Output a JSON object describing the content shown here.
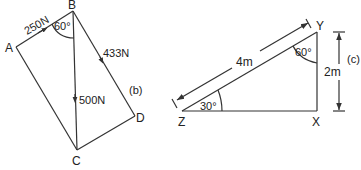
{
  "figure_b": {
    "points": {
      "A": "A",
      "B": "B",
      "C": "C",
      "D": "D"
    },
    "force_AB": "250N",
    "force_BD": "433N",
    "force_BC": "500N",
    "angle_ABC": "60°",
    "label": "(b)"
  },
  "figure_c": {
    "points": {
      "Z": "Z",
      "X": "X",
      "Y": "Y"
    },
    "length_ZY": "4m",
    "length_XY": "2m",
    "angle_Z": "30°",
    "angle_Y": "60°",
    "label": "(c)"
  },
  "colors": {
    "line": "#333333",
    "text": "#222222"
  }
}
